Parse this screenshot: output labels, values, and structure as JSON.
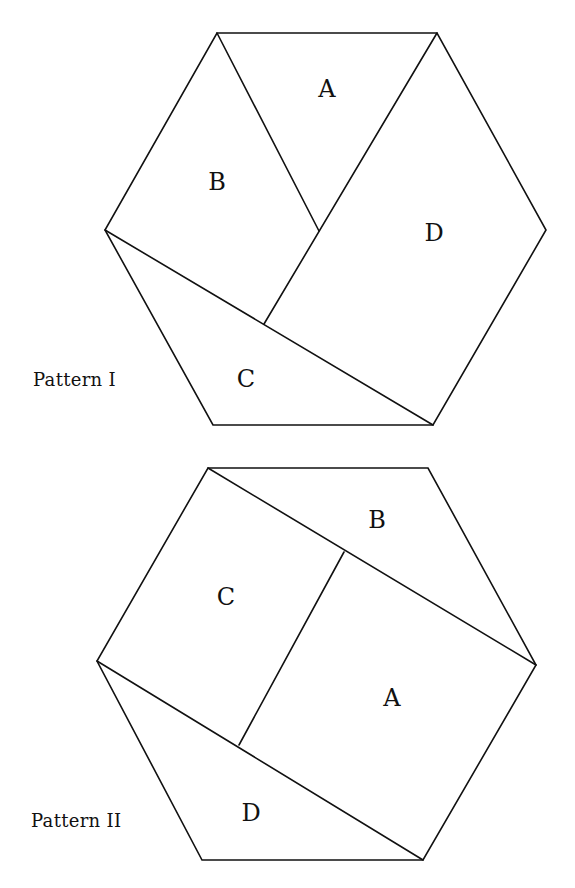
{
  "figure": {
    "patterns": [
      {
        "caption": "Pattern I",
        "caption_pos": {
          "x": 33,
          "y": 369
        },
        "hexagon": [
          [
            217,
            33
          ],
          [
            437,
            33
          ],
          [
            546,
            230
          ],
          [
            433,
            425
          ],
          [
            213,
            425
          ],
          [
            105,
            230
          ]
        ],
        "cuts": [
          [
            [
              217,
              33
            ],
            [
              319,
              231
            ]
          ],
          [
            [
              437,
              33
            ],
            [
              264,
              324
            ]
          ],
          [
            [
              105,
              230
            ],
            [
              433,
              425
            ]
          ]
        ],
        "pieces": [
          {
            "label": "A",
            "x": 327,
            "y": 89
          },
          {
            "label": "B",
            "x": 217,
            "y": 182
          },
          {
            "label": "C",
            "x": 246,
            "y": 379
          },
          {
            "label": "D",
            "x": 434,
            "y": 233
          }
        ]
      },
      {
        "caption": "Pattern II",
        "caption_pos": {
          "x": 31,
          "y": 810
        },
        "hexagon": [
          [
            208,
            468
          ],
          [
            428,
            468
          ],
          [
            536,
            665
          ],
          [
            423,
            860
          ],
          [
            202,
            860
          ],
          [
            97,
            661
          ]
        ],
        "cuts": [
          [
            [
              208,
              468
            ],
            [
              536,
              665
            ]
          ],
          [
            [
              344,
              552
            ],
            [
              239,
              745
            ]
          ],
          [
            [
              97,
              661
            ],
            [
              423,
              860
            ]
          ]
        ],
        "pieces": [
          {
            "label": "B",
            "x": 377,
            "y": 520
          },
          {
            "label": "C",
            "x": 226,
            "y": 597
          },
          {
            "label": "A",
            "x": 392,
            "y": 698
          },
          {
            "label": "D",
            "x": 251,
            "y": 813
          }
        ]
      }
    ]
  }
}
